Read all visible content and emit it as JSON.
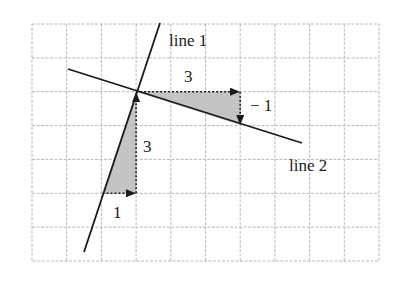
{
  "diagram": {
    "type": "slope-comparison",
    "grid": {
      "x0": 32,
      "y0": 24,
      "x1": 379,
      "y1": 261,
      "columns": 10,
      "rows": 7,
      "line_color": "#b8b8b8"
    },
    "colors": {
      "line": "#1a1a1a",
      "shade": "#c4c4c4",
      "arrow": "#1a1a1a"
    },
    "lines": [
      {
        "name": "line 1",
        "label": "line 1"
      },
      {
        "name": "line 2",
        "label": "line 2"
      }
    ],
    "line1": {
      "label": "line 1",
      "slope_run_label": "1",
      "slope_rise_label": "3"
    },
    "line2": {
      "label": "line 2",
      "slope_run_label": "3",
      "slope_rise_label": "− 1"
    }
  }
}
